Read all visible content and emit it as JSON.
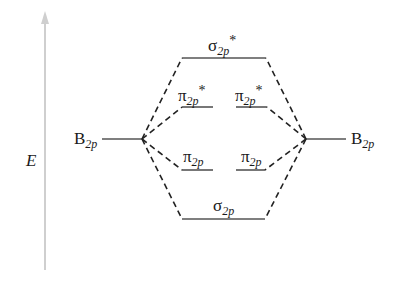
{
  "diagram": {
    "type": "molecular-orbital-energy-diagram",
    "axis": {
      "label": "E",
      "color": "#c8c8c8"
    },
    "atomic_orbitals": {
      "left": {
        "symbol": "B",
        "subscript": "2p"
      },
      "right": {
        "symbol": "B",
        "subscript": "2p"
      }
    },
    "molecular_orbitals": {
      "sigma_star": {
        "symbol": "σ",
        "subscript": "2p",
        "superscript": "*"
      },
      "pi_star_left": {
        "symbol": "π",
        "subscript": "2p",
        "superscript": "*"
      },
      "pi_star_right": {
        "symbol": "π",
        "subscript": "2p",
        "superscript": "*"
      },
      "pi_left": {
        "symbol": "π",
        "subscript": "2p"
      },
      "pi_right": {
        "symbol": "π",
        "subscript": "2p"
      },
      "sigma": {
        "symbol": "σ",
        "subscript": "2p"
      }
    },
    "line_color": "#333333",
    "level_color": "#555555"
  }
}
